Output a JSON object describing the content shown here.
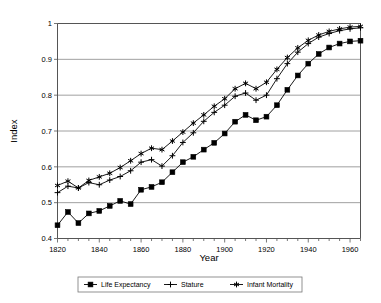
{
  "chart_data": {
    "type": "line",
    "title": "",
    "xlabel": "Year",
    "ylabel": "Index",
    "xlim": [
      1820,
      1965
    ],
    "ylim": [
      0.4,
      1.0
    ],
    "grid": true,
    "legend_position": "bottom",
    "x_ticks_major": [
      1820,
      1840,
      1860,
      1880,
      1900,
      1920,
      1940,
      1960
    ],
    "x_tick_labels": [
      "1820",
      "1840",
      "1860",
      "1880",
      "1900",
      "1920",
      "1940",
      "1960"
    ],
    "x_ticks_minor_step": 5,
    "y_ticks": [
      0.4,
      0.5,
      0.6,
      0.7,
      0.8,
      0.9,
      1.0
    ],
    "y_tick_labels": [
      "0.4",
      "0.5",
      "0.6",
      "0.7",
      "0.8",
      "0.9",
      "1"
    ],
    "x": [
      1820,
      1825,
      1830,
      1835,
      1840,
      1845,
      1850,
      1855,
      1860,
      1865,
      1870,
      1875,
      1880,
      1885,
      1890,
      1895,
      1900,
      1905,
      1910,
      1915,
      1920,
      1925,
      1930,
      1935,
      1940,
      1945,
      1950,
      1955,
      1960,
      1965
    ],
    "series": [
      {
        "name": "Life Expectancy",
        "marker": "filled-square",
        "values": [
          0.437,
          0.474,
          0.443,
          0.47,
          0.477,
          0.491,
          0.505,
          0.496,
          0.536,
          0.544,
          0.557,
          0.585,
          0.613,
          0.628,
          0.648,
          0.667,
          0.693,
          0.726,
          0.745,
          0.73,
          0.74,
          0.772,
          0.815,
          0.855,
          0.888,
          0.915,
          0.933,
          0.944,
          0.95,
          0.952
        ]
      },
      {
        "name": "Stature",
        "marker": "plus",
        "values": [
          0.528,
          0.546,
          0.541,
          0.556,
          0.55,
          0.563,
          0.573,
          0.589,
          0.613,
          0.62,
          0.602,
          0.631,
          0.668,
          0.695,
          0.727,
          0.752,
          0.772,
          0.797,
          0.806,
          0.786,
          0.8,
          0.846,
          0.888,
          0.92,
          0.944,
          0.962,
          0.972,
          0.98,
          0.985,
          0.988
        ]
      },
      {
        "name": "Infant Mortality",
        "marker": "asterisk",
        "values": [
          0.548,
          0.56,
          0.541,
          0.562,
          0.572,
          0.582,
          0.598,
          0.617,
          0.637,
          0.652,
          0.648,
          0.672,
          0.697,
          0.722,
          0.745,
          0.769,
          0.79,
          0.818,
          0.833,
          0.818,
          0.836,
          0.872,
          0.905,
          0.932,
          0.953,
          0.968,
          0.978,
          0.985,
          0.99,
          0.992
        ]
      }
    ]
  },
  "legend": {
    "items": [
      {
        "label": "Life Expectancy",
        "marker": "filled-square"
      },
      {
        "label": "Stature",
        "marker": "plus"
      },
      {
        "label": "Infant Mortality",
        "marker": "asterisk"
      }
    ]
  },
  "colors": {
    "series": "#000000",
    "grid": "#888888",
    "axis": "#555555",
    "background": "#ffffff"
  }
}
